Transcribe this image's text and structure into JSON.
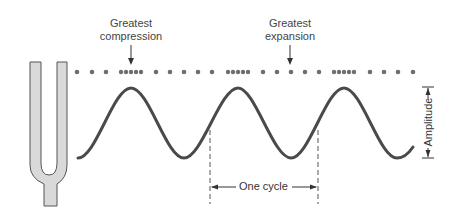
{
  "labels": {
    "greatest_compression_line1": "Greatest",
    "greatest_compression_line2": "compression",
    "greatest_expansion_line1": "Greatest",
    "greatest_expansion_line2": "expansion",
    "one_cycle": "One cycle",
    "amplitude": "Amplitude"
  },
  "colors": {
    "wave": "#4a4a4a",
    "dots": "#6e6e6e",
    "fork_fill": "#d9d9d9",
    "fork_stroke": "#555555",
    "annotation": "#333333"
  },
  "elements": {
    "tuning_fork": "tuning-fork",
    "wave": "sine-wave (3 cycles)",
    "particles": "air-molecule dots with 3 compression clusters"
  }
}
